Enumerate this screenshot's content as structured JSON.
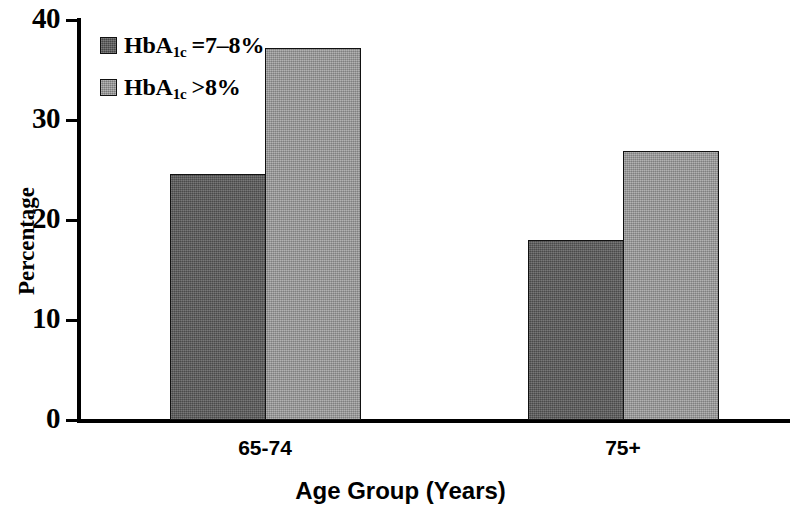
{
  "chart_data": {
    "type": "bar",
    "title": "",
    "subtitle": "",
    "xlabel": "Age Group (Years)",
    "ylabel": "Percentage",
    "categories": [
      "65-74",
      "75+"
    ],
    "ylim": [
      0,
      40
    ],
    "yticks": [
      0,
      10,
      20,
      30,
      40
    ],
    "ytick_labels": [
      "0",
      "10",
      "20",
      "30",
      "40"
    ],
    "grid": false,
    "legend_position": "top-left-inside",
    "series": [
      {
        "name": "HbA1c =7-8%",
        "name_parts": {
          "base": "HbA",
          "sub": "1c",
          "op": "=7–8%"
        },
        "color": "#5a5a5a",
        "values": [
          24.6,
          18.0
        ]
      },
      {
        "name": "HbA1c >8%",
        "name_parts": {
          "base": "HbA",
          "sub": "1c",
          "op": ">8%"
        },
        "color": "#9b9b9b",
        "values": [
          37.2,
          26.9
        ]
      }
    ]
  },
  "axes": {
    "y": {
      "label": "Percentage",
      "ticks": [
        {
          "value": 40,
          "label": "40"
        },
        {
          "value": 30,
          "label": "30"
        },
        {
          "value": 20,
          "label": "20"
        },
        {
          "value": 10,
          "label": "10"
        },
        {
          "value": 0,
          "label": "0"
        }
      ]
    },
    "x": {
      "label": "Age Group (Years)",
      "ticks": [
        {
          "label": "65-74"
        },
        {
          "label": "75+"
        }
      ]
    }
  },
  "legend": {
    "items": [
      {
        "base": "HbA",
        "sub": "1c",
        "op": "=7–8%",
        "swatch": "dark"
      },
      {
        "base": "HbA",
        "sub": "1c",
        "op": ">8%",
        "swatch": "light"
      }
    ]
  },
  "colors": {
    "series_dark": "#5a5a5a",
    "series_light": "#9b9b9b",
    "axis": "#000000",
    "background": "#ffffff"
  }
}
